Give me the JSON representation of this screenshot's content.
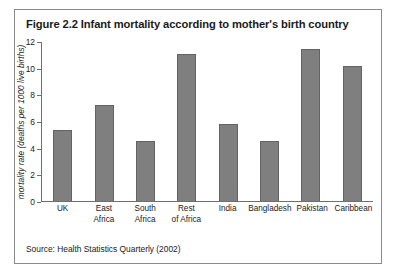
{
  "figure": {
    "title": "Figure 2.2 Infant mortality according to mother's birth country",
    "source": "Source: Health Statistics Quarterly (2002)"
  },
  "chart_data": {
    "type": "bar",
    "title": "Figure 2.2 Infant mortality according to mother's birth country",
    "xlabel": "",
    "ylabel": "mortality rate (deaths per 1000 live births)",
    "ylim": [
      0,
      12
    ],
    "yticks": [
      0,
      2,
      4,
      6,
      8,
      10,
      12
    ],
    "grid": false,
    "legend": null,
    "bar_color": "#7f7f7f",
    "categories": [
      "UK",
      "East Africa",
      "South Africa",
      "Rest of Africa",
      "India",
      "Bangladesh",
      "Pakistan",
      "Caribbean"
    ],
    "category_lines": [
      [
        "UK"
      ],
      [
        "East",
        "Africa"
      ],
      [
        "South",
        "Africa"
      ],
      [
        "Rest",
        "of Africa"
      ],
      [
        "India"
      ],
      [
        "Bangladesh"
      ],
      [
        "Pakistan"
      ],
      [
        "Caribbean"
      ]
    ],
    "values": [
      5.3,
      7.2,
      4.5,
      11.0,
      5.8,
      4.5,
      11.4,
      10.1
    ],
    "annotation": "Source: Health Statistics Quarterly (2002)"
  }
}
